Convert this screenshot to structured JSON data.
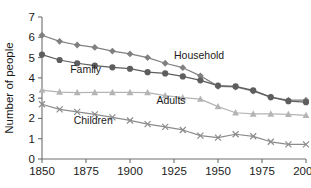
{
  "chart_data": {
    "type": "line",
    "title": "",
    "subtitle": "",
    "xlabel": "",
    "ylabel": "Number of people",
    "xlim": [
      1850,
      2000
    ],
    "ylim": [
      0,
      7
    ],
    "grid": false,
    "legend_position": "inline-annotations",
    "x_ticks": [
      "1850",
      "1875",
      "1900",
      "1925",
      "1950",
      "1975",
      "2000"
    ],
    "x_tick_values": [
      1850,
      1875,
      1900,
      1925,
      1950,
      1975,
      2000
    ],
    "y_ticks": [
      "0",
      "1",
      "2",
      "3",
      "4",
      "5",
      "6",
      "7"
    ],
    "y_tick_values": [
      0,
      1,
      2,
      3,
      4,
      5,
      6,
      7
    ],
    "x": [
      1850,
      1860,
      1870,
      1880,
      1890,
      1900,
      1910,
      1920,
      1930,
      1940,
      1950,
      1960,
      1970,
      1980,
      1990,
      2000
    ],
    "series": [
      {
        "name": "Household",
        "marker": "diamond",
        "color": "#808080",
        "values": [
          6.1,
          5.8,
          5.62,
          5.5,
          5.32,
          5.18,
          5.0,
          4.72,
          4.5,
          4.1,
          3.58,
          3.55,
          3.35,
          3.05,
          2.9,
          2.9
        ]
      },
      {
        "name": "Family",
        "marker": "circle",
        "color": "#5e5e5e",
        "values": [
          5.15,
          4.88,
          4.72,
          4.6,
          4.52,
          4.45,
          4.28,
          4.22,
          4.07,
          3.88,
          3.62,
          3.58,
          3.38,
          3.05,
          2.85,
          2.8
        ]
      },
      {
        "name": "Adults",
        "marker": "triangle",
        "color": "#b4b4b4",
        "values": [
          3.4,
          3.3,
          3.27,
          3.28,
          3.28,
          3.28,
          3.27,
          3.12,
          3.02,
          2.95,
          2.58,
          2.28,
          2.22,
          2.22,
          2.2,
          2.15
        ]
      },
      {
        "name": "Children",
        "marker": "x",
        "color": "#8c8c8c",
        "values": [
          2.7,
          2.45,
          2.32,
          2.2,
          2.05,
          1.9,
          1.72,
          1.58,
          1.43,
          1.15,
          1.05,
          1.22,
          1.12,
          0.85,
          0.72,
          0.72
        ]
      }
    ],
    "annotations": [
      {
        "text": "Household",
        "x": 1925,
        "y": 4.95,
        "series": "Household"
      },
      {
        "text": "Family",
        "x": 1866,
        "y": 4.22,
        "series": "Family"
      },
      {
        "text": "Adults",
        "x": 1915,
        "y": 2.72,
        "series": "Adults"
      },
      {
        "text": "Children",
        "x": 1868,
        "y": 1.72,
        "series": "Children"
      }
    ]
  },
  "axes": {
    "y_axis_title": "Number of people"
  }
}
